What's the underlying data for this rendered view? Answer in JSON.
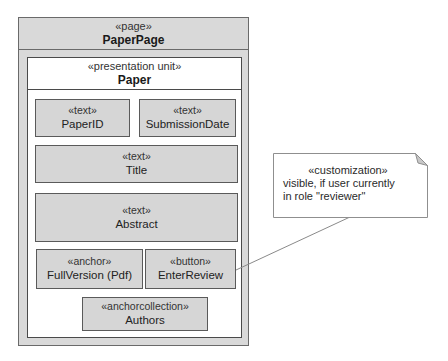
{
  "diagram": {
    "page": {
      "stereotype": "«page»",
      "name": "PaperPage"
    },
    "presentation_unit": {
      "stereotype": "«presentation unit»",
      "name": "Paper"
    },
    "elements": [
      {
        "stereotype": "«text»",
        "name": "PaperID"
      },
      {
        "stereotype": "«text»",
        "name": "SubmissionDate"
      },
      {
        "stereotype": "«text»",
        "name": "Title"
      },
      {
        "stereotype": "«text»",
        "name": "Abstract"
      },
      {
        "stereotype": "«anchor»",
        "name": "FullVersion (Pdf)"
      },
      {
        "stereotype": "«button»",
        "name": "EnterReview"
      },
      {
        "stereotype": "«anchorcollection»",
        "name": "Authors"
      }
    ],
    "note": {
      "stereotype": "«customization»",
      "line1": "visible, if user currently",
      "line2": "in role \"reviewer\"",
      "attached_to": "EnterReview"
    },
    "colors": {
      "element_fill": "#d6d6d6",
      "page_fill": "#d9d9d9",
      "border": "#5a5a5a",
      "connector": "#8a8a8a"
    }
  }
}
